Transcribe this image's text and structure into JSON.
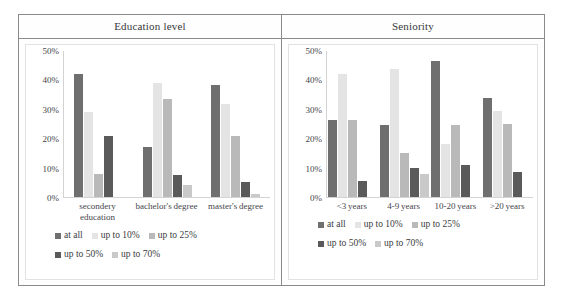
{
  "chart_data": [
    {
      "type": "bar",
      "title": "Education level",
      "xlabel": "",
      "ylabel": "",
      "ylim": [
        0,
        50
      ],
      "yticks": [
        50,
        40,
        30,
        20,
        10,
        0
      ],
      "ytick_labels": [
        "50%",
        "40%",
        "30%",
        "20%",
        "10%",
        "0%"
      ],
      "grid": false,
      "legend_position": "bottom",
      "categories": [
        "secondery education",
        "bachelor's degree",
        "master's degree"
      ],
      "series": [
        {
          "name": "at all",
          "color": "#6f6f6f",
          "values": [
            42,
            17,
            38.5
          ]
        },
        {
          "name": "up to 10%",
          "color": "#e4e4e4",
          "values": [
            29,
            39,
            32
          ]
        },
        {
          "name": "up to 25%",
          "color": "#b9b9b9",
          "values": [
            8,
            33.5,
            21
          ]
        },
        {
          "name": "up to 50%",
          "color": "#5a5a5a",
          "values": [
            21,
            7.5,
            5
          ]
        },
        {
          "name": "up to 70%",
          "color": "#c9c9c9",
          "values": [
            0,
            4,
            1
          ]
        }
      ]
    },
    {
      "type": "bar",
      "title": "Seniority",
      "xlabel": "",
      "ylabel": "",
      "ylim": [
        0,
        50
      ],
      "yticks": [
        50,
        40,
        30,
        20,
        10,
        0
      ],
      "ytick_labels": [
        "50%",
        "40%",
        "30%",
        "20%",
        "10%",
        "0%"
      ],
      "grid": false,
      "legend_position": "bottom",
      "categories": [
        "<3 years",
        "4-9 years",
        "10-20 years",
        ">20 years"
      ],
      "series": [
        {
          "name": "at all",
          "color": "#6f6f6f",
          "values": [
            26.5,
            24.5,
            46.5,
            34
          ]
        },
        {
          "name": "up to 10%",
          "color": "#e4e4e4",
          "values": [
            42,
            44,
            18,
            29.5
          ]
        },
        {
          "name": "up to 25%",
          "color": "#b9b9b9",
          "values": [
            26.5,
            15,
            24.5,
            25
          ]
        },
        {
          "name": "up to 50%",
          "color": "#5a5a5a",
          "values": [
            5.5,
            10,
            11,
            8.5
          ]
        },
        {
          "name": "up to 70%",
          "color": "#c9c9c9",
          "values": [
            0,
            8,
            0,
            0
          ]
        }
      ]
    }
  ],
  "panels": [
    {
      "header": "Education level",
      "yticks": [
        "50%",
        "40%",
        "30%",
        "20%",
        "10%",
        "0%"
      ],
      "categories": [
        "secondery education",
        "bachelor's degree",
        "master's degree"
      ],
      "legend": [
        {
          "label": "at all",
          "color": "#6f6f6f"
        },
        {
          "label": "up to 10%",
          "color": "#e4e4e4"
        },
        {
          "label": "up to 25%",
          "color": "#b9b9b9"
        },
        {
          "label": "up to 50%",
          "color": "#5a5a5a"
        },
        {
          "label": "up to 70%",
          "color": "#c9c9c9"
        }
      ]
    },
    {
      "header": "Seniority",
      "yticks": [
        "50%",
        "40%",
        "30%",
        "20%",
        "10%",
        "0%"
      ],
      "categories": [
        "<3 years",
        "4-9 years",
        "10-20 years",
        ">20 years"
      ],
      "legend": [
        {
          "label": "at all",
          "color": "#6f6f6f"
        },
        {
          "label": "up to 10%",
          "color": "#e4e4e4"
        },
        {
          "label": "up to 25%",
          "color": "#b9b9b9"
        },
        {
          "label": "up to 50%",
          "color": "#5a5a5a"
        },
        {
          "label": "up to 70%",
          "color": "#c9c9c9"
        }
      ]
    }
  ]
}
